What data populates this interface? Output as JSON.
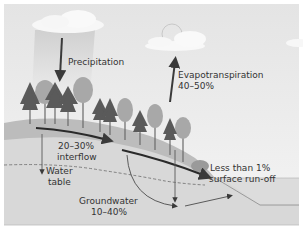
{
  "diagram": {
    "type": "water-cycle-forest-hydrology",
    "labels": {
      "precipitation": "Precipitation",
      "evapotranspiration_name": "Evapotranspiration",
      "evapotranspiration_pct": "40–50%",
      "interflow_pct": "20–30%",
      "interflow_name": "interflow",
      "water_table_line1": "Water",
      "water_table_line2": "table",
      "groundwater_name": "Groundwater",
      "groundwater_pct": "10–40%",
      "runoff_pct": "Less than 1%",
      "runoff_name": "surface run-off"
    },
    "colors": {
      "sky_top": "#e6e6e6",
      "sky_bottom": "#f3f3f3",
      "cloud": "#f8f8f8",
      "rain_column": "#d8d8d8",
      "topsoil": "#bdbdbd",
      "subsoil": "#d4d4d4",
      "ground": "#dcdcdc",
      "arrow": "#3a3a3a",
      "conifer": "#5a5a5a",
      "deciduous": "#a8a8a8",
      "text": "#333333"
    },
    "flows": [
      {
        "name": "Precipitation",
        "direction": "down"
      },
      {
        "name": "Evapotranspiration",
        "value": "40–50%",
        "direction": "up"
      },
      {
        "name": "Interflow",
        "value": "20–30%",
        "direction": "downslope"
      },
      {
        "name": "Groundwater",
        "value": "10–40%",
        "direction": "down-and-lateral"
      },
      {
        "name": "Surface run-off",
        "value": "Less than 1%",
        "direction": "downslope"
      }
    ]
  }
}
